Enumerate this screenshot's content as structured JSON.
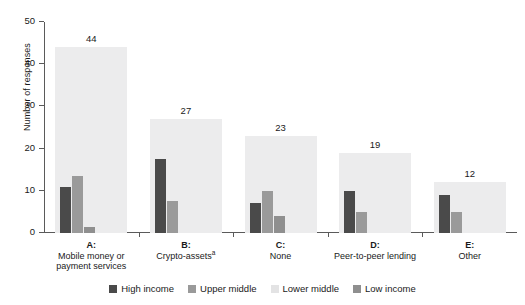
{
  "chart_data": {
    "type": "bar",
    "title": "",
    "subtitle": "",
    "xlabel": "",
    "ylabel": "Number of responses",
    "ylim": [
      0,
      50
    ],
    "yticks": [
      0,
      10,
      20,
      30,
      40,
      50
    ],
    "grid": false,
    "legend_position": "bottom",
    "categories": [
      {
        "key": "A:",
        "name": "Mobile money or payment services",
        "footnote": ""
      },
      {
        "key": "B:",
        "name": "Crypto-assets",
        "footnote": "a"
      },
      {
        "key": "C:",
        "name": "None",
        "footnote": ""
      },
      {
        "key": "D:",
        "name": "Peer-to-peer lending",
        "footnote": ""
      },
      {
        "key": "E:",
        "name": "Other",
        "footnote": ""
      }
    ],
    "totals": [
      44,
      27,
      23,
      19,
      12
    ],
    "series": [
      {
        "name": "High income",
        "color": "#4a4a4a",
        "values": [
          11,
          17.5,
          7,
          10,
          9
        ]
      },
      {
        "name": "Upper middle",
        "color": "#9a9a9a",
        "values": [
          13.5,
          7.5,
          10,
          5,
          5
        ]
      },
      {
        "name": "Lower middle",
        "color": "#ececed",
        "values": [
          44,
          27,
          23,
          19,
          12
        ]
      },
      {
        "name": "Low income",
        "color": "#8f8f8f",
        "values": [
          1.5,
          0,
          4,
          0,
          0
        ]
      }
    ]
  },
  "legend": {
    "items": [
      {
        "label": "High income",
        "color": "#4a4a4a"
      },
      {
        "label": "Upper middle",
        "color": "#9a9a9a"
      },
      {
        "label": "Lower middle",
        "color": "#e3e3e4"
      },
      {
        "label": "Low income",
        "color": "#8f8f8f"
      }
    ]
  },
  "axis": {
    "y_title": "Number of responses",
    "y_tick_labels": [
      "50",
      "40",
      "30",
      "20",
      "10",
      "0"
    ]
  }
}
